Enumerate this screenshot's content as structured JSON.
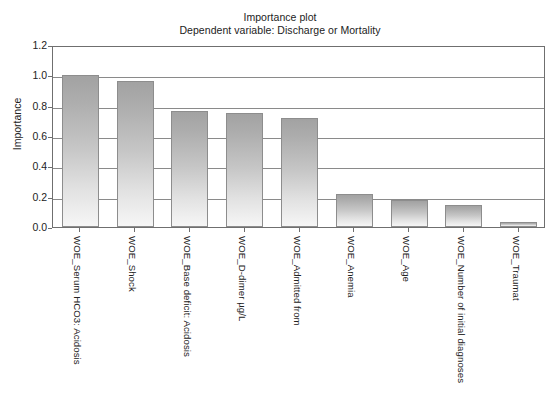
{
  "title": {
    "line1": "Importance plot",
    "line2": "Dependent variable: Discharge or Mortality"
  },
  "chart_data": {
    "type": "bar",
    "title": "Importance plot",
    "subtitle": "Dependent variable: Discharge or Mortality",
    "xlabel": "",
    "ylabel": "Importance",
    "ylim": [
      0.0,
      1.2
    ],
    "yticks": [
      "0.0",
      "0.2",
      "0.4",
      "0.6",
      "0.8",
      "1.0",
      "1.2"
    ],
    "grid": true,
    "legend": "none",
    "categories": [
      "WOE_Serum HCO3: Acidosis",
      "WOE_Shock",
      "WOE_Base deficit: Acidosis",
      "WOE_D-dimer µg/L",
      "WOE_Admitted from",
      "WOE_Anemia",
      "WOE_Age",
      "WOE_Number of initial diagnoses",
      "WOE_Traumat"
    ],
    "values": [
      1.0,
      0.965,
      0.765,
      0.755,
      0.72,
      0.215,
      0.175,
      0.145,
      0.035
    ],
    "bar_fill_top": "#a2a2a2",
    "bar_fill_bottom": "#f6f6f6",
    "bar_border": "#8d8d8d",
    "grid_color": "#8a8a8a",
    "frame_color": "#6f6f6f",
    "background": "#ffffff"
  }
}
